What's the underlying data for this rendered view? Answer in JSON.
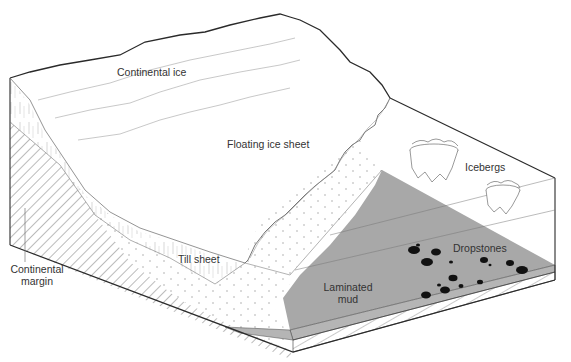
{
  "diagram": {
    "labels": {
      "continental_ice": "Continental ice",
      "floating_ice_sheet": "Floating ice sheet",
      "icebergs": "Icebergs",
      "till_sheet": "Till sheet",
      "dropstones": "Dropstones",
      "laminated_mud_line1": "Laminated",
      "laminated_mud_line2": "mud",
      "continental_margin_line1": "Continental",
      "continental_margin_line2": "margin"
    },
    "colors": {
      "outline": "#2a2a2a",
      "mud_fill": "#a8a8a8",
      "mud_side": "#b5b5b5",
      "ice_texture": "#b0b0b0",
      "dropstone": "#111111",
      "background": "#ffffff"
    }
  }
}
